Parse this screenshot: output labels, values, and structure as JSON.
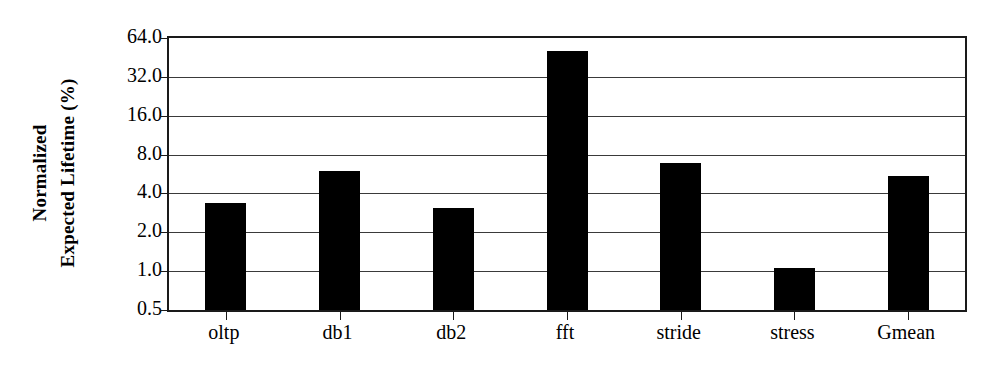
{
  "chart_data": {
    "type": "bar",
    "title": "",
    "xlabel": "",
    "ylabel": "Normalized Expected Lifetime (%)",
    "ylabel_lines": [
      "Normalized",
      "Expected Lifetime (%)"
    ],
    "categories": [
      "oltp",
      "db1",
      "db2",
      "fft",
      "stride",
      "stress",
      "Gmean"
    ],
    "values": [
      3.4,
      6.0,
      3.1,
      51.0,
      6.9,
      1.05,
      5.5
    ],
    "yscale": "log2",
    "ylim": [
      0.5,
      64.0
    ],
    "yticks": [
      0.5,
      1.0,
      2.0,
      4.0,
      8.0,
      16.0,
      32.0,
      64.0
    ],
    "ytick_labels": [
      "0.5",
      "1.0",
      "2.0",
      "4.0",
      "8.0",
      "16.0",
      "32.0",
      "64.0"
    ],
    "grid": true,
    "legend": null,
    "bar_color": "#000000",
    "axis_color": "#1a1a1a",
    "grid_color": "#3a3a3a",
    "background_color": "#ffffff"
  }
}
